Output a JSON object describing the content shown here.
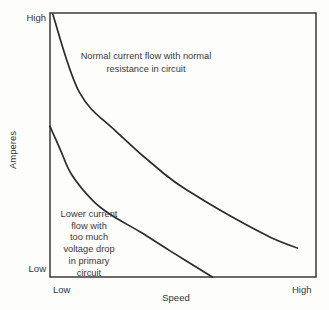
{
  "figure": {
    "type": "textbook-graph"
  },
  "axes": {
    "y_label": "Amperes",
    "x_label": "Speed",
    "y_tick_top": "High",
    "y_tick_bottom": "Low",
    "x_tick_left": "Low",
    "x_tick_right": "High"
  },
  "annotations": {
    "upper_curve": "Normal current flow with normal\nresistance in circuit",
    "lower_curve": "Lower current\nflow with\ntoo much\nvoltage drop\nin primary\ncircuit"
  },
  "colors": {
    "curve": "#2c2c2c",
    "frame": "#2c2c2c",
    "background": "#fdfdfc",
    "text": "#3a3a3a"
  },
  "chart_data": {
    "type": "line",
    "title": "",
    "xlabel": "Speed",
    "ylabel": "Amperes",
    "x_axis_ticks": [
      "Low",
      "High"
    ],
    "y_axis_ticks": [
      "Low",
      "High"
    ],
    "x_range": [
      0,
      1
    ],
    "y_range": [
      0,
      1
    ],
    "grid": false,
    "legend_position": "none",
    "series": [
      {
        "name": "Normal current flow with normal resistance in circuit",
        "x": [
          0.01,
          0.11,
          0.25,
          0.43,
          0.53,
          0.68,
          0.83,
          0.93
        ],
        "y": [
          0.996,
          0.7,
          0.55,
          0.39,
          0.32,
          0.23,
          0.15,
          0.11
        ]
      },
      {
        "name": "Lower current flow with too much voltage drop in primary circuit",
        "x": [
          0.0,
          0.04,
          0.08,
          0.16,
          0.23,
          0.34,
          0.45,
          0.61
        ],
        "y": [
          0.57,
          0.48,
          0.39,
          0.29,
          0.235,
          0.17,
          0.1,
          0.0
        ]
      }
    ]
  }
}
